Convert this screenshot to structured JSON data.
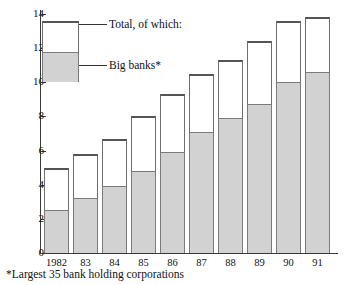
{
  "chart_data": {
    "type": "bar",
    "title": "",
    "xlabel": "",
    "ylabel": "",
    "ylim": [
      0,
      14
    ],
    "grid": false,
    "stacked": true,
    "legend_position": "inside-top-left",
    "categories": [
      "1982",
      "83",
      "84",
      "85",
      "86",
      "87",
      "88",
      "89",
      "90",
      "91"
    ],
    "series": [
      {
        "name": "Total, of which:",
        "values": [
          5.0,
          5.8,
          6.7,
          8.0,
          9.3,
          10.5,
          11.3,
          12.4,
          13.6,
          13.8
        ]
      },
      {
        "name": "Big banks*",
        "values": [
          2.5,
          3.2,
          3.9,
          4.8,
          5.9,
          7.1,
          7.9,
          8.7,
          10.0,
          10.6
        ]
      }
    ],
    "y_ticks": [
      "0",
      "2",
      "4",
      "6",
      "8",
      "10",
      "12",
      "14"
    ],
    "y_tick_values": [
      0,
      2,
      4,
      6,
      8,
      10,
      12,
      14
    ],
    "annotations": [
      "*Largest 35 bank holding corporations"
    ],
    "colors": {
      "total_fill": "#ffffff",
      "big_banks_fill": "#d2d2d2",
      "outline": "#6e6e6e",
      "axis": "#3a3a3a",
      "text": "#111111"
    }
  },
  "legend": {
    "total_label": "Total, of which:",
    "big_banks_label": "Big banks*"
  },
  "footnote": {
    "text": "*Largest 35 bank holding corporations"
  }
}
